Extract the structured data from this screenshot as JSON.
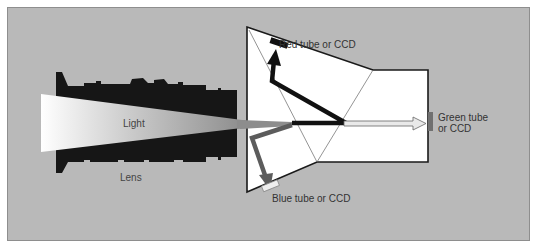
{
  "diagram": {
    "labels": {
      "light": "Light",
      "lens": "Lens",
      "red": "Red tube or CCD",
      "green_line1": "Green tube",
      "green_line2": "or CCD",
      "blue": "Blue tube or CCD"
    },
    "nodes": [
      {
        "id": "lens",
        "label": "Lens",
        "type": "optical-element"
      },
      {
        "id": "light",
        "label": "Light",
        "type": "beam"
      },
      {
        "id": "prism",
        "label": "",
        "type": "beam-splitter-prism"
      },
      {
        "id": "red",
        "label": "Red tube or CCD",
        "type": "sensor"
      },
      {
        "id": "green",
        "label": "Green tube or CCD",
        "type": "sensor"
      },
      {
        "id": "blue",
        "label": "Blue tube or CCD",
        "type": "sensor"
      }
    ],
    "edges": [
      {
        "from": "light",
        "to": "lens"
      },
      {
        "from": "lens",
        "to": "prism"
      },
      {
        "from": "prism",
        "to": "red",
        "beam": "red"
      },
      {
        "from": "prism",
        "to": "green",
        "beam": "green"
      },
      {
        "from": "prism",
        "to": "blue",
        "beam": "blue"
      }
    ],
    "colors": {
      "background": "#b9b9b9",
      "lens": "#1a1a1a",
      "prism_fill": "#ffffff",
      "red_beam": "#111111",
      "blue_beam": "#5a5a5a",
      "green_beam": "#e6e6e6",
      "green_sensor": "#6e6e6e"
    }
  }
}
